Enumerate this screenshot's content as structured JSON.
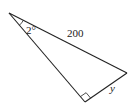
{
  "diagram": {
    "type": "right-triangle",
    "colors": {
      "stroke": "#222222",
      "background": "#ffffff"
    },
    "vertices": {
      "apex": {
        "x": 9,
        "y": 13
      },
      "right": {
        "x": 127,
        "y": 73
      },
      "right_angle": {
        "x": 85,
        "y": 102
      }
    },
    "labels": {
      "angle": "2°",
      "hypotenuse": "200",
      "opposite_side": "y"
    },
    "markers": {
      "right_angle_marker": true,
      "angle_arc_at_apex": true
    }
  }
}
